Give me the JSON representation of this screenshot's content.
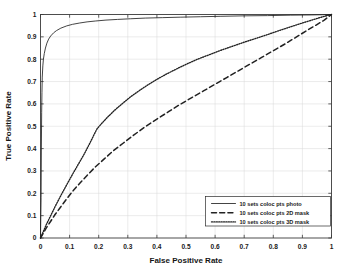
{
  "chart_data": {
    "type": "line",
    "title": "",
    "xlabel": "False Positive Rate",
    "ylabel": "True Positive Rate",
    "xlim": [
      0,
      1
    ],
    "ylim": [
      0,
      1
    ],
    "xticks": [
      "0",
      "0.1",
      "0.2",
      "0.3",
      "0.4",
      "0.5",
      "0.6",
      "0.7",
      "0.8",
      "0.9",
      "1"
    ],
    "yticks": [
      "0",
      "0.1",
      "0.2",
      "0.3",
      "0.4",
      "0.5",
      "0.6",
      "0.7",
      "0.8",
      "0.9",
      "1"
    ],
    "xtick_values": [
      0,
      0.1,
      0.2,
      0.3,
      0.4,
      0.5,
      0.6,
      0.7,
      0.8,
      0.9,
      1
    ],
    "ytick_values": [
      0,
      0.1,
      0.2,
      0.3,
      0.4,
      0.5,
      0.6,
      0.7,
      0.8,
      0.9,
      1
    ],
    "grid": true,
    "legend_position": "lower right",
    "series": [
      {
        "name": "10 sets coloc pts photo",
        "style": "solid",
        "color": "#222222",
        "points": [
          [
            0.0,
            0.0
          ],
          [
            0.002,
            0.18
          ],
          [
            0.003,
            0.4
          ],
          [
            0.004,
            0.56
          ],
          [
            0.005,
            0.65
          ],
          [
            0.006,
            0.72
          ],
          [
            0.008,
            0.77
          ],
          [
            0.01,
            0.8
          ],
          [
            0.013,
            0.825
          ],
          [
            0.017,
            0.85
          ],
          [
            0.022,
            0.872
          ],
          [
            0.028,
            0.89
          ],
          [
            0.035,
            0.904
          ],
          [
            0.045,
            0.918
          ],
          [
            0.055,
            0.928
          ],
          [
            0.07,
            0.939
          ],
          [
            0.09,
            0.949
          ],
          [
            0.11,
            0.956
          ],
          [
            0.135,
            0.962
          ],
          [
            0.16,
            0.967
          ],
          [
            0.19,
            0.971
          ],
          [
            0.225,
            0.975
          ],
          [
            0.265,
            0.978
          ],
          [
            0.31,
            0.981
          ],
          [
            0.36,
            0.984
          ],
          [
            0.42,
            0.986
          ],
          [
            0.48,
            0.988
          ],
          [
            0.55,
            0.99
          ],
          [
            0.62,
            0.992
          ],
          [
            0.7,
            0.994
          ],
          [
            0.78,
            0.995
          ],
          [
            0.86,
            0.997
          ],
          [
            0.93,
            0.998
          ],
          [
            0.97,
            0.999
          ],
          [
            1.0,
            1.0
          ]
        ]
      },
      {
        "name": "10 sets coloc pts 2D mask",
        "style": "dashed",
        "color": "#222222",
        "points": [
          [
            0.0,
            0.0
          ],
          [
            0.01,
            0.022
          ],
          [
            0.02,
            0.045
          ],
          [
            0.035,
            0.075
          ],
          [
            0.05,
            0.105
          ],
          [
            0.07,
            0.14
          ],
          [
            0.09,
            0.175
          ],
          [
            0.11,
            0.208
          ],
          [
            0.135,
            0.245
          ],
          [
            0.16,
            0.28
          ],
          [
            0.19,
            0.32
          ],
          [
            0.22,
            0.355
          ],
          [
            0.25,
            0.39
          ],
          [
            0.285,
            0.425
          ],
          [
            0.32,
            0.46
          ],
          [
            0.36,
            0.498
          ],
          [
            0.4,
            0.532
          ],
          [
            0.44,
            0.565
          ],
          [
            0.48,
            0.598
          ],
          [
            0.52,
            0.628
          ],
          [
            0.56,
            0.658
          ],
          [
            0.6,
            0.688
          ],
          [
            0.64,
            0.718
          ],
          [
            0.68,
            0.748
          ],
          [
            0.72,
            0.778
          ],
          [
            0.76,
            0.808
          ],
          [
            0.8,
            0.838
          ],
          [
            0.84,
            0.868
          ],
          [
            0.88,
            0.9
          ],
          [
            0.92,
            0.932
          ],
          [
            0.95,
            0.955
          ],
          [
            0.975,
            0.975
          ],
          [
            1.0,
            1.0
          ]
        ]
      },
      {
        "name": "10 sets coloc pts 3D mask",
        "style": "dotted",
        "color": "#222222",
        "points": [
          [
            0.0,
            0.0
          ],
          [
            0.01,
            0.03
          ],
          [
            0.02,
            0.06
          ],
          [
            0.035,
            0.1
          ],
          [
            0.05,
            0.14
          ],
          [
            0.07,
            0.19
          ],
          [
            0.09,
            0.238
          ],
          [
            0.11,
            0.285
          ],
          [
            0.13,
            0.33
          ],
          [
            0.15,
            0.375
          ],
          [
            0.17,
            0.425
          ],
          [
            0.185,
            0.465
          ],
          [
            0.195,
            0.49
          ],
          [
            0.21,
            0.512
          ],
          [
            0.23,
            0.54
          ],
          [
            0.255,
            0.572
          ],
          [
            0.28,
            0.6
          ],
          [
            0.31,
            0.632
          ],
          [
            0.34,
            0.66
          ],
          [
            0.37,
            0.686
          ],
          [
            0.4,
            0.71
          ],
          [
            0.435,
            0.735
          ],
          [
            0.47,
            0.758
          ],
          [
            0.505,
            0.78
          ],
          [
            0.54,
            0.8
          ],
          [
            0.58,
            0.82
          ],
          [
            0.62,
            0.84
          ],
          [
            0.66,
            0.858
          ],
          [
            0.7,
            0.876
          ],
          [
            0.74,
            0.893
          ],
          [
            0.78,
            0.91
          ],
          [
            0.82,
            0.928
          ],
          [
            0.86,
            0.945
          ],
          [
            0.9,
            0.962
          ],
          [
            0.94,
            0.978
          ],
          [
            0.97,
            0.99
          ],
          [
            1.0,
            1.0
          ]
        ]
      }
    ],
    "legend": [
      {
        "label": "10 sets coloc pts photo",
        "style": "solid"
      },
      {
        "label": "10 sets coloc pts 2D mask",
        "style": "dashed"
      },
      {
        "label": "10 sets coloc pts 3D mask",
        "style": "dotted"
      }
    ]
  }
}
